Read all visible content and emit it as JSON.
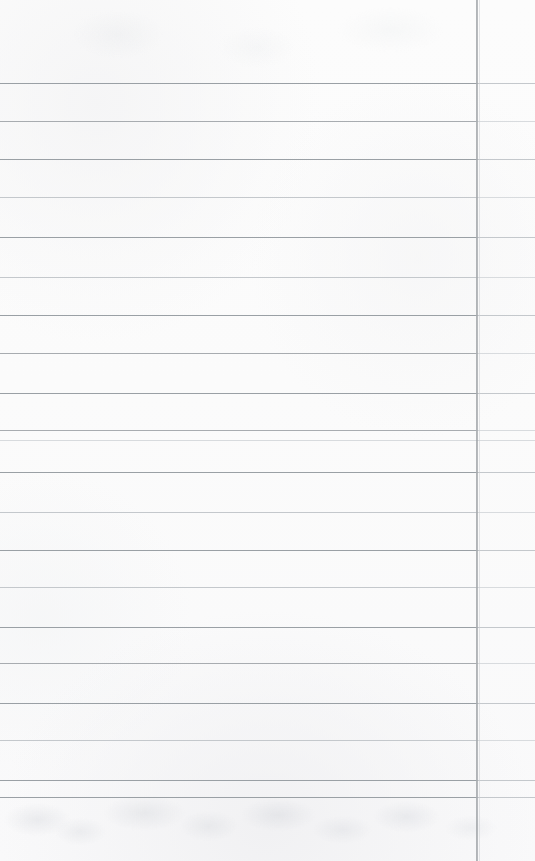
{
  "document": {
    "kind": "scanned-lined-paper",
    "title": "Blank ruled ledger page",
    "description": "Scanned blank notebook / ledger sheet with horizontal ruled lines and a single vertical column rule near the right edge.",
    "page_width": 535,
    "page_height": 861,
    "text_content": "",
    "handwriting_present": "no",
    "printed_text_present": "no"
  },
  "colors": {
    "paper": "#fdfdfd",
    "paper_shadow": "#f7f7f8",
    "rule_dark": "#9aa0a5",
    "rule_medium": "#a8acb0",
    "rule_light": "#c4c8cc",
    "rule_faint": "#d8dbde",
    "vertical_rule": "#969a9e",
    "bleed_through": "#e4e6e9"
  },
  "layout": {
    "top_margin_px": 83,
    "bottom_margin_px": 64,
    "left_margin_px": 0,
    "rule_spacing_px": 38,
    "horizontal_rule_count": 21,
    "vertical_rule_count": 1
  },
  "vertical_rules": [
    {
      "name": "column-divider",
      "x": 476,
      "width": 2,
      "top": 0,
      "height": 861,
      "tone": "dark"
    }
  ],
  "horizontal_rules": [
    {
      "y": 83,
      "tone": "dark",
      "left": 0,
      "right": 535
    },
    {
      "y": 121,
      "tone": "medium",
      "left": 0,
      "right": 535
    },
    {
      "y": 159,
      "tone": "dark",
      "left": 0,
      "right": 535
    },
    {
      "y": 197,
      "tone": "light",
      "left": 0,
      "right": 535
    },
    {
      "y": 237,
      "tone": "dark",
      "left": 0,
      "right": 535
    },
    {
      "y": 277,
      "tone": "light",
      "left": 0,
      "right": 535
    },
    {
      "y": 315,
      "tone": "dark",
      "left": 0,
      "right": 535
    },
    {
      "y": 353,
      "tone": "medium",
      "left": 0,
      "right": 535
    },
    {
      "y": 393,
      "tone": "dark",
      "left": 0,
      "right": 535
    },
    {
      "y": 430,
      "tone": "medium",
      "left": 0,
      "right": 535
    },
    {
      "y": 440,
      "tone": "faint",
      "left": 0,
      "right": 535
    },
    {
      "y": 472,
      "tone": "dark",
      "left": 0,
      "right": 535
    },
    {
      "y": 512,
      "tone": "light",
      "left": 0,
      "right": 535
    },
    {
      "y": 550,
      "tone": "dark",
      "left": 0,
      "right": 535
    },
    {
      "y": 587,
      "tone": "light",
      "left": 0,
      "right": 535
    },
    {
      "y": 627,
      "tone": "dark",
      "left": 0,
      "right": 535
    },
    {
      "y": 663,
      "tone": "medium",
      "left": 0,
      "right": 535
    },
    {
      "y": 703,
      "tone": "dark",
      "left": 0,
      "right": 535
    },
    {
      "y": 740,
      "tone": "light",
      "left": 0,
      "right": 535
    },
    {
      "y": 780,
      "tone": "dark",
      "left": 0,
      "right": 535
    },
    {
      "y": 797,
      "tone": "dark",
      "left": 0,
      "right": 535
    }
  ]
}
